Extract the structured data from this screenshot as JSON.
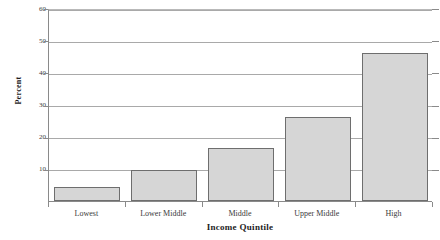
{
  "chart_data": {
    "type": "bar",
    "title": "",
    "xlabel": "Income Quintile",
    "ylabel": "Percent",
    "categories": [
      "Lowest",
      "Lower Middle",
      "Middle",
      "Upper Middle",
      "High"
    ],
    "values": [
      4.4,
      9.5,
      16.5,
      26,
      46
    ],
    "ylim": [
      0,
      60
    ],
    "yticks": [
      0,
      10,
      20,
      30,
      40,
      50,
      60
    ],
    "ytick_labels": [
      "",
      "10",
      "20",
      "30",
      "40",
      "50",
      "60"
    ],
    "grid": true,
    "legend": false,
    "legend_position": "none",
    "series": [
      {
        "name": "Percent",
        "values": [
          4.4,
          9.5,
          16.5,
          26,
          46
        ]
      }
    ]
  },
  "style": {
    "bar_fill": "#d6d6d6",
    "bar_border": "#6e6e6e",
    "gridline_color": "#a9a9a9",
    "axis_color": "#8a8a8a",
    "text_color": "#2a2a2a",
    "background": "#ffffff"
  },
  "top_clipped_text": {
    "fragment_a": "·",
    "fragment_b": "·",
    "fragment_c": "·"
  }
}
